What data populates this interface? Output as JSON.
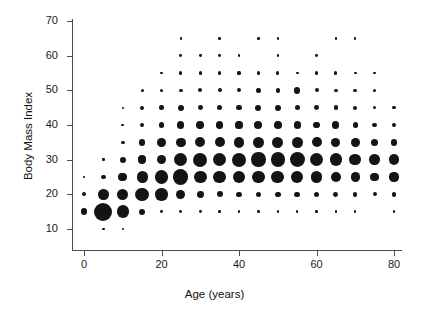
{
  "chart_data": {
    "type": "scatter",
    "title": "",
    "subtitle": "",
    "xlabel": "Age (years)",
    "ylabel": "Body Mass Index",
    "xlim": [
      -3,
      83
    ],
    "ylim": [
      8,
      72
    ],
    "xticks": [
      0,
      20,
      40,
      60,
      80
    ],
    "yticks": [
      10,
      20,
      30,
      40,
      50,
      60,
      70
    ],
    "xticklabels": [
      "0",
      "20",
      "40",
      "60",
      "80"
    ],
    "yticklabels": [
      "10",
      "20",
      "30",
      "40",
      "50",
      "60",
      "70"
    ],
    "grid": false,
    "legend": null,
    "marker_color": "#141414",
    "marker_shape": "circle",
    "size_encodes": "count",
    "points": [
      {
        "x": 0,
        "y": 25,
        "r": 1.2
      },
      {
        "x": 0,
        "y": 20,
        "r": 2.0
      },
      {
        "x": 0,
        "y": 15,
        "r": 3.2
      },
      {
        "x": 5,
        "y": 30,
        "r": 1.2
      },
      {
        "x": 5,
        "y": 25,
        "r": 2.4
      },
      {
        "x": 5,
        "y": 20,
        "r": 5.2
      },
      {
        "x": 5,
        "y": 15,
        "r": 9.0
      },
      {
        "x": 5,
        "y": 10,
        "r": 1.2
      },
      {
        "x": 10,
        "y": 45,
        "r": 1.0
      },
      {
        "x": 10,
        "y": 40,
        "r": 1.4
      },
      {
        "x": 10,
        "y": 35,
        "r": 1.8
      },
      {
        "x": 10,
        "y": 30,
        "r": 3.0
      },
      {
        "x": 10,
        "y": 25,
        "r": 4.4
      },
      {
        "x": 10,
        "y": 20,
        "r": 5.6
      },
      {
        "x": 10,
        "y": 15,
        "r": 6.2
      },
      {
        "x": 10,
        "y": 10,
        "r": 1.2
      },
      {
        "x": 15,
        "y": 50,
        "r": 1.6
      },
      {
        "x": 15,
        "y": 45,
        "r": 2.0
      },
      {
        "x": 15,
        "y": 40,
        "r": 2.2
      },
      {
        "x": 15,
        "y": 35,
        "r": 3.2
      },
      {
        "x": 15,
        "y": 30,
        "r": 4.2
      },
      {
        "x": 15,
        "y": 25,
        "r": 5.6
      },
      {
        "x": 15,
        "y": 20,
        "r": 6.8
      },
      {
        "x": 15,
        "y": 15,
        "r": 3.0
      },
      {
        "x": 20,
        "y": 55,
        "r": 1.4
      },
      {
        "x": 20,
        "y": 50,
        "r": 1.6
      },
      {
        "x": 20,
        "y": 45,
        "r": 2.2
      },
      {
        "x": 20,
        "y": 40,
        "r": 2.8
      },
      {
        "x": 20,
        "y": 35,
        "r": 4.4
      },
      {
        "x": 20,
        "y": 30,
        "r": 4.6
      },
      {
        "x": 20,
        "y": 25,
        "r": 6.6
      },
      {
        "x": 20,
        "y": 20,
        "r": 6.2
      },
      {
        "x": 20,
        "y": 15,
        "r": 1.4
      },
      {
        "x": 25,
        "y": 65,
        "r": 1.2
      },
      {
        "x": 25,
        "y": 60,
        "r": 1.4
      },
      {
        "x": 25,
        "y": 55,
        "r": 1.6
      },
      {
        "x": 25,
        "y": 50,
        "r": 1.8
      },
      {
        "x": 25,
        "y": 45,
        "r": 3.0
      },
      {
        "x": 25,
        "y": 40,
        "r": 3.6
      },
      {
        "x": 25,
        "y": 35,
        "r": 4.8
      },
      {
        "x": 25,
        "y": 30,
        "r": 6.6
      },
      {
        "x": 25,
        "y": 25,
        "r": 7.6
      },
      {
        "x": 25,
        "y": 20,
        "r": 4.4
      },
      {
        "x": 25,
        "y": 15,
        "r": 1.4
      },
      {
        "x": 30,
        "y": 60,
        "r": 1.4
      },
      {
        "x": 30,
        "y": 55,
        "r": 1.6
      },
      {
        "x": 30,
        "y": 50,
        "r": 2.0
      },
      {
        "x": 30,
        "y": 45,
        "r": 2.4
      },
      {
        "x": 30,
        "y": 40,
        "r": 3.8
      },
      {
        "x": 30,
        "y": 35,
        "r": 5.0
      },
      {
        "x": 30,
        "y": 30,
        "r": 7.0
      },
      {
        "x": 30,
        "y": 25,
        "r": 6.4
      },
      {
        "x": 30,
        "y": 20,
        "r": 3.4
      },
      {
        "x": 30,
        "y": 15,
        "r": 1.4
      },
      {
        "x": 35,
        "y": 65,
        "r": 1.2
      },
      {
        "x": 35,
        "y": 60,
        "r": 1.4
      },
      {
        "x": 35,
        "y": 55,
        "r": 1.6
      },
      {
        "x": 35,
        "y": 50,
        "r": 2.0
      },
      {
        "x": 35,
        "y": 45,
        "r": 2.6
      },
      {
        "x": 35,
        "y": 40,
        "r": 3.8
      },
      {
        "x": 35,
        "y": 35,
        "r": 5.0
      },
      {
        "x": 35,
        "y": 30,
        "r": 6.8
      },
      {
        "x": 35,
        "y": 25,
        "r": 6.2
      },
      {
        "x": 35,
        "y": 20,
        "r": 3.0
      },
      {
        "x": 35,
        "y": 15,
        "r": 1.2
      },
      {
        "x": 40,
        "y": 60,
        "r": 1.2
      },
      {
        "x": 40,
        "y": 55,
        "r": 1.6
      },
      {
        "x": 40,
        "y": 50,
        "r": 2.0
      },
      {
        "x": 40,
        "y": 45,
        "r": 2.6
      },
      {
        "x": 40,
        "y": 40,
        "r": 3.6
      },
      {
        "x": 40,
        "y": 35,
        "r": 5.2
      },
      {
        "x": 40,
        "y": 30,
        "r": 7.0
      },
      {
        "x": 40,
        "y": 25,
        "r": 6.2
      },
      {
        "x": 40,
        "y": 20,
        "r": 2.8
      },
      {
        "x": 40,
        "y": 15,
        "r": 1.2
      },
      {
        "x": 45,
        "y": 65,
        "r": 1.2
      },
      {
        "x": 45,
        "y": 55,
        "r": 1.6
      },
      {
        "x": 45,
        "y": 50,
        "r": 2.2
      },
      {
        "x": 45,
        "y": 45,
        "r": 3.0
      },
      {
        "x": 45,
        "y": 40,
        "r": 4.0
      },
      {
        "x": 45,
        "y": 35,
        "r": 5.4
      },
      {
        "x": 45,
        "y": 30,
        "r": 7.2
      },
      {
        "x": 45,
        "y": 25,
        "r": 6.4
      },
      {
        "x": 45,
        "y": 20,
        "r": 2.6
      },
      {
        "x": 45,
        "y": 15,
        "r": 1.2
      },
      {
        "x": 50,
        "y": 65,
        "r": 1.2
      },
      {
        "x": 50,
        "y": 60,
        "r": 1.2
      },
      {
        "x": 50,
        "y": 55,
        "r": 1.6
      },
      {
        "x": 50,
        "y": 50,
        "r": 2.2
      },
      {
        "x": 50,
        "y": 45,
        "r": 3.0
      },
      {
        "x": 50,
        "y": 40,
        "r": 3.8
      },
      {
        "x": 50,
        "y": 35,
        "r": 5.6
      },
      {
        "x": 50,
        "y": 30,
        "r": 7.2
      },
      {
        "x": 50,
        "y": 25,
        "r": 6.4
      },
      {
        "x": 50,
        "y": 20,
        "r": 2.8
      },
      {
        "x": 50,
        "y": 15,
        "r": 1.2
      },
      {
        "x": 55,
        "y": 55,
        "r": 1.4
      },
      {
        "x": 55,
        "y": 50,
        "r": 3.2
      },
      {
        "x": 55,
        "y": 45,
        "r": 2.6
      },
      {
        "x": 55,
        "y": 40,
        "r": 3.6
      },
      {
        "x": 55,
        "y": 35,
        "r": 5.4
      },
      {
        "x": 55,
        "y": 30,
        "r": 7.4
      },
      {
        "x": 55,
        "y": 25,
        "r": 6.0
      },
      {
        "x": 55,
        "y": 20,
        "r": 2.8
      },
      {
        "x": 55,
        "y": 15,
        "r": 1.2
      },
      {
        "x": 60,
        "y": 60,
        "r": 1.4
      },
      {
        "x": 60,
        "y": 55,
        "r": 1.6
      },
      {
        "x": 60,
        "y": 50,
        "r": 2.0
      },
      {
        "x": 60,
        "y": 45,
        "r": 2.4
      },
      {
        "x": 60,
        "y": 40,
        "r": 3.4
      },
      {
        "x": 60,
        "y": 35,
        "r": 5.0
      },
      {
        "x": 60,
        "y": 30,
        "r": 6.6
      },
      {
        "x": 60,
        "y": 25,
        "r": 5.8
      },
      {
        "x": 60,
        "y": 20,
        "r": 2.6
      },
      {
        "x": 60,
        "y": 15,
        "r": 1.2
      },
      {
        "x": 65,
        "y": 65,
        "r": 1.2
      },
      {
        "x": 65,
        "y": 55,
        "r": 1.6
      },
      {
        "x": 65,
        "y": 50,
        "r": 1.8
      },
      {
        "x": 65,
        "y": 45,
        "r": 2.2
      },
      {
        "x": 65,
        "y": 40,
        "r": 3.6
      },
      {
        "x": 65,
        "y": 35,
        "r": 4.6
      },
      {
        "x": 65,
        "y": 30,
        "r": 6.2
      },
      {
        "x": 65,
        "y": 25,
        "r": 5.2
      },
      {
        "x": 65,
        "y": 20,
        "r": 2.4
      },
      {
        "x": 65,
        "y": 15,
        "r": 1.2
      },
      {
        "x": 70,
        "y": 65,
        "r": 1.2
      },
      {
        "x": 70,
        "y": 55,
        "r": 1.4
      },
      {
        "x": 70,
        "y": 50,
        "r": 1.8
      },
      {
        "x": 70,
        "y": 45,
        "r": 2.0
      },
      {
        "x": 70,
        "y": 40,
        "r": 2.6
      },
      {
        "x": 70,
        "y": 35,
        "r": 4.4
      },
      {
        "x": 70,
        "y": 30,
        "r": 5.8
      },
      {
        "x": 70,
        "y": 25,
        "r": 4.6
      },
      {
        "x": 70,
        "y": 20,
        "r": 2.2
      },
      {
        "x": 70,
        "y": 15,
        "r": 1.2
      },
      {
        "x": 75,
        "y": 55,
        "r": 1.2
      },
      {
        "x": 75,
        "y": 50,
        "r": 1.6
      },
      {
        "x": 75,
        "y": 45,
        "r": 1.8
      },
      {
        "x": 75,
        "y": 40,
        "r": 2.4
      },
      {
        "x": 75,
        "y": 35,
        "r": 3.6
      },
      {
        "x": 75,
        "y": 30,
        "r": 5.2
      },
      {
        "x": 75,
        "y": 25,
        "r": 4.2
      },
      {
        "x": 75,
        "y": 20,
        "r": 2.0
      },
      {
        "x": 80,
        "y": 45,
        "r": 1.8
      },
      {
        "x": 80,
        "y": 40,
        "r": 2.2
      },
      {
        "x": 80,
        "y": 35,
        "r": 3.4
      },
      {
        "x": 80,
        "y": 30,
        "r": 5.4
      },
      {
        "x": 80,
        "y": 25,
        "r": 4.6
      },
      {
        "x": 80,
        "y": 20,
        "r": 2.2
      },
      {
        "x": 80,
        "y": 15,
        "r": 1.4
      }
    ]
  }
}
